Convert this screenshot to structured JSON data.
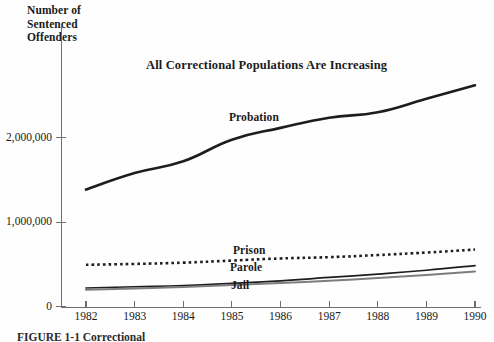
{
  "figure": {
    "y_axis_title": "Number of\nSentenced\nOffenders",
    "caption": "FIGURE 1-1   Correctional",
    "background_color": "#fefefe",
    "axis_color": "#6f6f6f"
  },
  "chart_data": {
    "type": "line",
    "title": "All Correctional Populations Are Increasing",
    "xlabel": "",
    "ylabel": "Number of Sentenced Offenders",
    "grid": false,
    "legend_position": "inline-annotations",
    "x": [
      1982,
      1983,
      1984,
      1985,
      1986,
      1987,
      1988,
      1989,
      1990
    ],
    "xticklabels": [
      "1982",
      "1983",
      "1984",
      "1985",
      "1986",
      "1987",
      "1988",
      "1989",
      "1990"
    ],
    "xlim": [
      1982,
      1990
    ],
    "ylim": [
      0,
      2800000
    ],
    "yticks": [
      0,
      1000000,
      2000000
    ],
    "yticklabels": [
      "0",
      "1,000,000",
      "2,000,000"
    ],
    "series": [
      {
        "name": "Probation",
        "label": "Probation",
        "style": "solid",
        "color": "#1d1d1d",
        "width": 2.6,
        "values": [
          1385000,
          1580000,
          1720000,
          1975000,
          2115000,
          2235000,
          2300000,
          2460000,
          2620000
        ]
      },
      {
        "name": "Prison",
        "label": "Prison",
        "style": "dotted",
        "color": "#1d1d1d",
        "width": 2.6,
        "values": [
          495000,
          505000,
          520000,
          545000,
          570000,
          585000,
          610000,
          640000,
          675000
        ]
      },
      {
        "name": "Parole",
        "label": "Parole",
        "style": "solid",
        "color": "#1d1d1d",
        "width": 1.7,
        "values": [
          220000,
          235000,
          250000,
          275000,
          305000,
          345000,
          385000,
          430000,
          485000
        ]
      },
      {
        "name": "Jail",
        "label": "Jail",
        "style": "solid",
        "color": "#7d7d7d",
        "width": 2.0,
        "values": [
          200000,
          215000,
          232000,
          255000,
          280000,
          305000,
          338000,
          375000,
          415000
        ]
      }
    ]
  }
}
